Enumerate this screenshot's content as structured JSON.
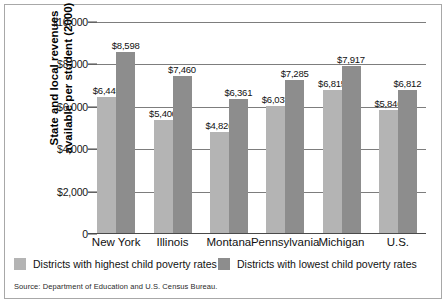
{
  "chart_data": {
    "type": "bar",
    "title": "",
    "xlabel": "",
    "ylabel": "State and local revenues available per student (2000)",
    "ylabel_line1": "State and local revenues",
    "ylabel_line2": "available per student (2000)",
    "categories": [
      "New York",
      "Illinois",
      "Montana",
      "Pennsylvania",
      "Michigan",
      "U.S."
    ],
    "series": [
      {
        "name": "Districts with highest child poverty rates",
        "color": "#b4b4b4",
        "values": [
          6445,
          5400,
          4826,
          6037,
          6815,
          5846
        ],
        "labels": [
          "$6,445",
          "$5,400",
          "$4,826",
          "$6,037",
          "$6,815",
          "$5,846"
        ]
      },
      {
        "name": "Districts with lowest child poverty rates",
        "color": "#8d8d8d",
        "values": [
          8598,
          7460,
          6361,
          7285,
          7917,
          6812
        ],
        "labels": [
          "$8,598",
          "$7,460",
          "$6,361",
          "$7,285",
          "$7,917",
          "$6,812"
        ]
      }
    ],
    "ylim": [
      0,
      10000
    ],
    "yticks": [
      0,
      2000,
      4000,
      6000,
      8000,
      10000
    ],
    "ytick_labels": [
      "0",
      "$2,000",
      "$4,000",
      "$6,000",
      "$8,000",
      "$10,000"
    ],
    "grid": true,
    "legend_position": "bottom"
  },
  "legend": {
    "items": [
      {
        "label": "Districts with highest child poverty rates",
        "color": "#b4b4b4"
      },
      {
        "label": "Districts with lowest child poverty rates",
        "color": "#8d8d8d"
      }
    ]
  },
  "source": {
    "note": "Source: Department of Education and U.S. Census Bureau."
  }
}
